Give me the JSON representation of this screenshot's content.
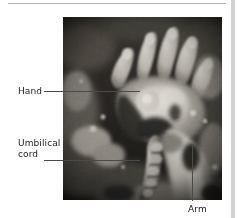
{
  "figure": {
    "kind": "fetal-ultrasound-photograph",
    "image_region": {
      "x": 63,
      "y": 17,
      "width": 159,
      "height": 183
    }
  },
  "rule": {
    "color": "#b6b6b6"
  },
  "gutter": {
    "color": "#d2d2d2"
  },
  "labels": [
    {
      "id": "hand",
      "text": "Hand",
      "lines": [
        "Hand"
      ],
      "x": 18,
      "y": 86,
      "leader": {
        "type": "horizontal",
        "x1": 44,
        "x2": 140,
        "y": 91
      }
    },
    {
      "id": "umbilical-cord",
      "text": "Umbilical cord",
      "lines": [
        "Umbilical",
        "cord"
      ],
      "x": 18,
      "y": 138,
      "leader": {
        "type": "horizontal",
        "x1": 44,
        "x2": 140,
        "y": 160
      }
    },
    {
      "id": "arm",
      "text": "Arm",
      "lines": [
        "Arm"
      ],
      "x": 188,
      "y": 204,
      "leader": {
        "type": "vertical",
        "y1": 145,
        "y2": 201,
        "x": 192
      }
    }
  ],
  "colors": {
    "leader_line": "#4a4a4a",
    "label_text": "#1a1a1a",
    "page_background": "#ffffff",
    "rule": "#b6b6b6",
    "gutter": "#d2d2d2"
  }
}
